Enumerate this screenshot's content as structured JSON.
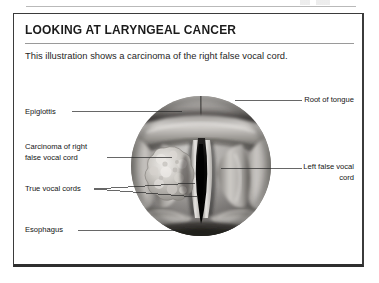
{
  "figure": {
    "title": "LOOKING AT LARYNGEAL CANCER",
    "subtitle": "This illustration shows a carcinoma of the right false vocal cord."
  },
  "labels": {
    "left": [
      {
        "id": "epiglottis",
        "text": "Epiglottis"
      },
      {
        "id": "carcinoma",
        "text": "Carcinoma of right\nfalse vocal cord"
      },
      {
        "id": "true_vocal_cords",
        "text": "True vocal cords"
      },
      {
        "id": "esophagus",
        "text": "Esophagus"
      }
    ],
    "right": [
      {
        "id": "root_of_tongue",
        "text": "Root of tongue"
      },
      {
        "id": "left_false_vocal_cord",
        "text": "Left false vocal\ncord"
      }
    ]
  },
  "illustration": {
    "type": "laryngoscopic-view",
    "description": "Grayscale anatomical illustration of the larynx viewed from above, showing a tumor mass on the right false vocal cord",
    "palette": {
      "tissue_light": "#d2d0ce",
      "tissue_mid": "#9b9896",
      "tissue_dark": "#5e5b59",
      "tissue_shadow": "#2f2d2c",
      "glottis_black": "#0d0c0c",
      "tumor_pale": "#e4e2de",
      "tumor_shade": "#a8a5a0",
      "rule_gray": "#9a9a9a",
      "frame_border": "#3b3b3b",
      "text": "#141414"
    }
  }
}
